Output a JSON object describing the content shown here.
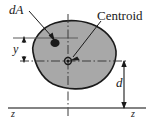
{
  "figure": {
    "type": "engineering-cross-section-centroid-diagram",
    "width": 153,
    "height": 124,
    "background_color": "#ffffff",
    "shape": {
      "name": "arbitrary-cross-section-area",
      "fill_color": "#a8a8a8",
      "stroke_color": "#1a1a1a",
      "stroke_width": 1.6,
      "path": "M 33 52 C 31 40 42 27 55 23 C 68 19 84 20 96 26 C 108 32 117 43 116 55 C 115 67 108 78 97 84 C 84 91 66 90 53 84 C 41 78 35 64 33 52 Z"
    },
    "labels": {
      "differential_area": "dA",
      "centroid": "Centroid",
      "y_distance": "y",
      "d_distance": "d",
      "reference_axis_left": "z",
      "reference_axis_right": "z"
    },
    "markers": {
      "dA_point": {
        "x": 55,
        "y": 43,
        "rx": 4.6,
        "ry": 4.0,
        "color": "#1a1a1a"
      },
      "centroid_point": {
        "x": 68,
        "y": 61,
        "r": 3.2,
        "color": "#1a1a1a"
      }
    },
    "axes": {
      "centroidal_horizontal": {
        "y": 61,
        "x1": 20,
        "x2": 126,
        "style": "dash-dot",
        "color": "#3a3a3a"
      },
      "centroidal_vertical": {
        "x": 68,
        "y1": 14,
        "y2": 116,
        "style": "dash-dot",
        "color": "#3a3a3a"
      },
      "dA_horizontal": {
        "y": 38,
        "x1": 13,
        "x2": 78,
        "style": "solid",
        "color": "#5a5a5a"
      },
      "reference_z_axis": {
        "y": 108,
        "x1": 8,
        "x2": 146,
        "style": "solid",
        "color": "#5a5a5a"
      }
    },
    "dimensions": [
      {
        "name": "y",
        "orientation": "vertical",
        "x": 24,
        "from_y": 38,
        "to_y": 61,
        "arrowheads": "both"
      },
      {
        "name": "d",
        "orientation": "vertical",
        "x": 124,
        "from_y": 61,
        "to_y": 108,
        "arrowheads": "both"
      }
    ],
    "leaders": [
      {
        "name": "dA-leader",
        "from": [
          29,
          11
        ],
        "to": [
          55,
          40
        ]
      },
      {
        "name": "centroid-leader",
        "from": [
          100,
          21
        ],
        "to": [
          70,
          59
        ]
      }
    ]
  }
}
